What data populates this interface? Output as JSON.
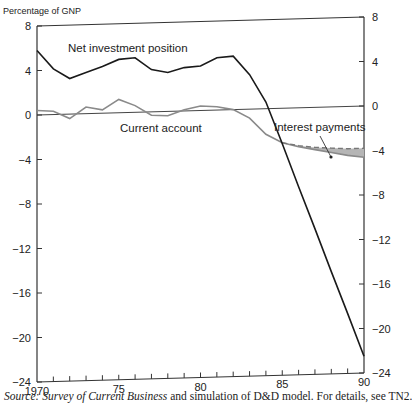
{
  "chart_data": {
    "type": "line",
    "title": "",
    "ylabel": "Percentage of GNP",
    "xlabel": "",
    "ylim": [
      -24,
      8
    ],
    "xlim": [
      1970,
      1990
    ],
    "y_ticks": [
      8,
      4,
      0,
      -4,
      -8,
      -12,
      -16,
      -20,
      -24
    ],
    "y_tick_labels": [
      "8",
      "4",
      "0",
      "−4",
      "−8",
      "−12",
      "−16",
      "−20",
      "−24"
    ],
    "x_ticks_major": [
      1970,
      1975,
      1980,
      1985,
      1990
    ],
    "x_tick_labels": [
      "1970",
      "75",
      "80",
      "85",
      "90"
    ],
    "x_ticks_minor": [
      1971,
      1972,
      1973,
      1974,
      1976,
      1977,
      1978,
      1979,
      1981,
      1982,
      1983,
      1984,
      1986,
      1987,
      1988,
      1989
    ],
    "grid": false,
    "legend": "inline labels",
    "reference_line": 0,
    "series": [
      {
        "name": "Net investment position",
        "style": "solid-dark",
        "x": [
          1970,
          1971,
          1972,
          1973,
          1974,
          1975,
          1976,
          1977,
          1978,
          1979,
          1980,
          1981,
          1982,
          1983,
          1984,
          1985,
          1986,
          1987,
          1988,
          1989,
          1990
        ],
        "values": [
          5.8,
          4.1,
          3.2,
          3.7,
          4.2,
          4.8,
          4.9,
          3.8,
          3.5,
          3.9,
          4.0,
          4.7,
          4.8,
          3.1,
          0.6,
          -3.2,
          -7.1,
          -10.9,
          -14.8,
          -18.6,
          -22.5
        ]
      },
      {
        "name": "Current account",
        "style": "solid-gray",
        "x": [
          1970,
          1971,
          1972,
          1973,
          1974,
          1975,
          1976,
          1977,
          1978,
          1979,
          1980,
          1981,
          1982,
          1983,
          1984,
          1985,
          1986,
          1987,
          1988,
          1989,
          1990
        ],
        "values": [
          0.4,
          0.3,
          -0.4,
          0.6,
          0.3,
          1.2,
          0.6,
          -0.3,
          -0.4,
          0.1,
          0.4,
          0.3,
          0.0,
          -0.8,
          -2.3,
          -3.1,
          -3.5,
          -3.8,
          -4.1,
          -4.4,
          -4.6
        ]
      },
      {
        "name": "Current account excluding interest payments",
        "style": "dashed-gray",
        "x": [
          1985,
          1986,
          1987,
          1988,
          1989,
          1990
        ],
        "values": [
          -3.1,
          -3.4,
          -3.6,
          -3.7,
          -3.8,
          -3.8
        ]
      }
    ],
    "shaded_region": {
      "name": "Interest payments",
      "between": [
        "Current account excluding interest payments",
        "Current account"
      ],
      "x_range": [
        1985,
        1990
      ],
      "color": "#b5b5b5"
    },
    "annotations": [
      {
        "text": "Net investment position",
        "anchor_series": "Net investment position"
      },
      {
        "text": "Current account",
        "anchor_series": "Current account"
      },
      {
        "text": "Interest payments",
        "points_to": "shaded_region"
      }
    ],
    "colors": {
      "net_investment": "#1a1a1a",
      "current_account": "#8a8a8a",
      "axis": "#333333"
    }
  },
  "source_note": {
    "prefix": "Source: ",
    "italic": "Survey of Current Business",
    "suffix": " and simulation of D&D model. For details, see TN2."
  }
}
